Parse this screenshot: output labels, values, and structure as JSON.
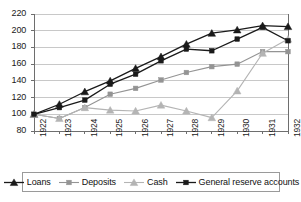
{
  "chart_data": {
    "type": "line",
    "title": "",
    "subtitle": "",
    "xlabel": "",
    "ylabel": "",
    "categories": [
      "1922",
      "1923",
      "1924",
      "1925",
      "1926",
      "1927",
      "1928",
      "1929",
      "1930",
      "1931",
      "1932"
    ],
    "ylim": [
      80,
      220
    ],
    "ytick_values": [
      80,
      100,
      120,
      140,
      160,
      180,
      200,
      220
    ],
    "ytick_labels": [
      "80",
      "100",
      "120",
      "140",
      "160",
      "180",
      "200",
      "220"
    ],
    "grid": true,
    "legend_position": "bottom",
    "series": [
      {
        "name": "Loans",
        "color": "#1a1a1a",
        "marker": "triangle",
        "values": [
          100,
          112,
          127,
          140,
          155,
          169,
          184,
          197,
          201,
          206,
          205
        ]
      },
      {
        "name": "Deposits",
        "color": "#949494",
        "marker": "square",
        "values": [
          100,
          95,
          108,
          124,
          131,
          141,
          150,
          157,
          160,
          175,
          175
        ]
      },
      {
        "name": "Cash",
        "color": "#b4b4b4",
        "marker": "triangle",
        "values": [
          100,
          95,
          108,
          105,
          104,
          111,
          104,
          96,
          128,
          173,
          190
        ]
      },
      {
        "name": "General reserve accounts",
        "color": "#1a1a1a",
        "marker": "square",
        "values": [
          100,
          108,
          117,
          136,
          148,
          164,
          178,
          176,
          190,
          204,
          188
        ]
      }
    ]
  },
  "legend": {
    "items": [
      {
        "label": "Loans"
      },
      {
        "label": "Deposits"
      },
      {
        "label": "Cash"
      },
      {
        "label": "General reserve accounts"
      }
    ]
  },
  "colors": {
    "axis": "#6e6e6e",
    "grid": "#c8c8c8",
    "plot_background": "#ffffff",
    "legend_border": "#9a9a9a"
  }
}
